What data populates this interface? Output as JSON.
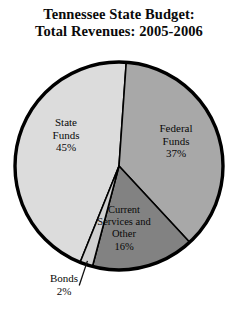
{
  "chart_data": {
    "type": "pie",
    "title": "Tennessee State Budget: Total Revenues: 2005-2006",
    "title_lines": [
      "Tennessee State Budget:",
      "Total Revenues: 2005-2006"
    ],
    "xlabel": "",
    "ylabel": "",
    "grid": false,
    "legend": "none",
    "labels_inside_slices": true,
    "units": "percent",
    "categories": [
      "State Funds",
      "Federal Funds",
      "Current Services and Other",
      "Bonds"
    ],
    "values": [
      45,
      37,
      16,
      2
    ],
    "slices": [
      {
        "name": "State Funds",
        "label_lines": [
          "State",
          "Funds",
          "45%"
        ],
        "value": 45,
        "value_text": "45%",
        "color": "#dcdcdc",
        "callout": false
      },
      {
        "name": "Federal Funds",
        "label_lines": [
          "Federal",
          "Funds",
          "37%"
        ],
        "value": 37,
        "value_text": "37%",
        "color": "#a8a8a8",
        "callout": false
      },
      {
        "name": "Current Services and Other",
        "label_lines": [
          "Current",
          "Services and",
          "Other",
          "16%"
        ],
        "value": 16,
        "value_text": "16%",
        "color": "#828282",
        "callout": false
      },
      {
        "name": "Bonds",
        "label_lines": [
          "Bonds",
          "2%"
        ],
        "value": 2,
        "value_text": "2%",
        "color": "#d0d0d0",
        "callout": true
      }
    ],
    "colors": {
      "state_funds": "#dcdcdc",
      "federal_funds": "#a8a8a8",
      "current_services": "#828282",
      "bonds": "#d0d0d0",
      "outline": "#000000",
      "background": "#ffffff",
      "text": "#080808"
    }
  }
}
